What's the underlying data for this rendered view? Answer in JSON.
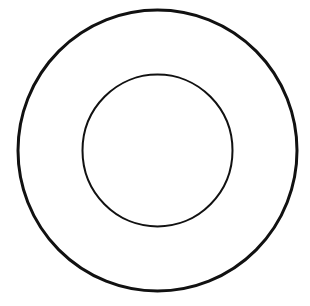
{
  "diagram": {
    "type": "concentric-circles",
    "background": "#ffffff",
    "stroke_color": "#111111",
    "shapes": [
      {
        "name": "outer-circle",
        "cx": 157.5,
        "cy": 150.5,
        "rx": 139.5,
        "ry": 140.5,
        "stroke_width": 3
      },
      {
        "name": "inner-circle",
        "cx": 157.5,
        "cy": 150.5,
        "rx": 75,
        "ry": 76,
        "stroke_width": 2
      }
    ]
  }
}
